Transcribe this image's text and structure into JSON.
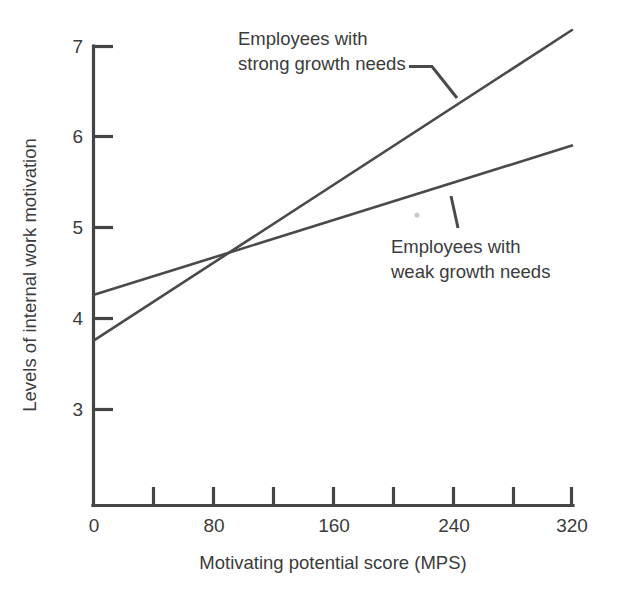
{
  "chart_data": {
    "type": "line",
    "title": "",
    "xlabel": "Motivating potential score (MPS)",
    "ylabel": "Levels of internal work motivation",
    "xlim": [
      0,
      320
    ],
    "ylim": [
      2.4,
      7.0
    ],
    "grid": false,
    "legend_position": "inline-annotations",
    "x_ticks": [
      0,
      40,
      80,
      120,
      160,
      200,
      240,
      280,
      320
    ],
    "x_tick_labels": [
      "0",
      "",
      "80",
      "",
      "160",
      "",
      "240",
      "",
      "320"
    ],
    "y_ticks": [
      3,
      4,
      5,
      6,
      7
    ],
    "y_tick_labels": [
      "3",
      "4",
      "5",
      "6",
      "7"
    ],
    "series": [
      {
        "name": "Employees with strong growth needs",
        "x": [
          0,
          320
        ],
        "values": [
          3.76,
          7.17
        ]
      },
      {
        "name": "Employees with weak growth needs",
        "x": [
          0,
          320
        ],
        "values": [
          4.26,
          5.9
        ]
      }
    ],
    "intersection": {
      "x": 95,
      "y": 4.73
    },
    "annotations": [
      {
        "id": "strong-growth-needs",
        "lines": [
          "Employees with",
          "strong growth needs"
        ],
        "target_series": "Employees with strong growth needs"
      },
      {
        "id": "weak-growth-needs",
        "lines": [
          "Employees with",
          "weak growth needs"
        ],
        "target_series": "Employees with weak growth needs"
      }
    ]
  },
  "axes": {
    "x_title": "Motivating potential score (MPS)",
    "y_title": "Levels of internal work motivation",
    "x_tick_0": "0",
    "x_tick_80": "80",
    "x_tick_160": "160",
    "x_tick_240": "240",
    "x_tick_320": "320",
    "y_tick_3": "3",
    "y_tick_4": "4",
    "y_tick_5": "5",
    "y_tick_6": "6",
    "y_tick_7": "7"
  },
  "annotations": {
    "strong": {
      "line1": "Employees with",
      "line2": "strong growth needs"
    },
    "weak": {
      "line1": "Employees with",
      "line2": "weak growth needs"
    }
  },
  "colors": {
    "ink": "#454545",
    "line": "#4a4a4a",
    "text": "#3b3b3b",
    "background": "#ffffff"
  }
}
